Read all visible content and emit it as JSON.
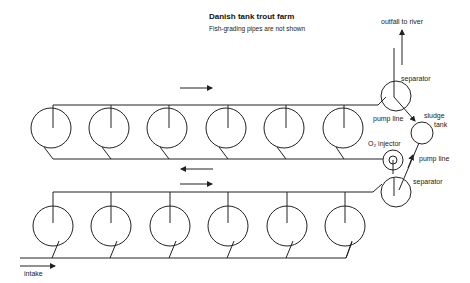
{
  "header": {
    "title": "Danish tank trout farm",
    "subtitle": "Fish-grading pipes are not shown"
  },
  "labels": {
    "outfall": "outfall to river",
    "separator_top": "separator",
    "pump_line_top": "pump line",
    "sludge_tank": "sludge\ntank",
    "sludge": "sludge",
    "tank": "tank",
    "o2_injector": "O₂ injector",
    "pump_line_bottom": "pump line",
    "separator_bottom": "separator",
    "intake": "intake"
  },
  "diagram": {
    "top_row_tanks": 6,
    "bottom_row_tanks": 6,
    "flow_arrows": [
      "top-row right",
      "return left",
      "bottom-row right",
      "intake right",
      "outfall up"
    ]
  }
}
